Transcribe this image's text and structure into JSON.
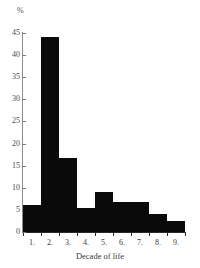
{
  "chart_data": {
    "type": "bar",
    "title": "",
    "subtitle": "",
    "xlabel": "Decade of life",
    "ylabel": "%",
    "categories": [
      "1.",
      "2.",
      "3.",
      "4.",
      "5.",
      "6.",
      "7.",
      "8.",
      "9."
    ],
    "values": [
      6,
      44,
      16.7,
      5.5,
      9,
      6.7,
      6.7,
      4,
      2.5
    ],
    "ylim": [
      0,
      45
    ],
    "ytick_labels": [
      "45",
      "40",
      "35",
      "30",
      "25",
      "20",
      "15",
      "10",
      "5",
      "0"
    ],
    "ytick_values": [
      45,
      40,
      35,
      30,
      25,
      20,
      15,
      10,
      5,
      0
    ],
    "grid": false,
    "legend": false,
    "bar_color": "#0a0a0a",
    "axis_color": "#2a2a2a",
    "text_color": "#3a3a3a"
  }
}
